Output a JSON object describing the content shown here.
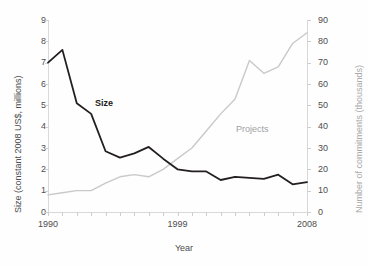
{
  "chart_data": {
    "type": "line",
    "title": "",
    "xlabel": "Year",
    "ylabel": "Size (constant 2008 US$, millions)",
    "y2label": "Number of commitments (thousands)",
    "x": [
      1990,
      1991,
      1992,
      1993,
      1994,
      1995,
      1996,
      1997,
      1998,
      1999,
      2000,
      2001,
      2002,
      2003,
      2004,
      2005,
      2006,
      2007,
      2008
    ],
    "xlim": [
      1990,
      2008
    ],
    "ylim": [
      0,
      9
    ],
    "y2lim": [
      0,
      90
    ],
    "xticks_labeled": [
      "1990",
      "1999",
      "2008"
    ],
    "yticks": [
      "0",
      "1",
      "2",
      "3",
      "4",
      "5",
      "6",
      "7",
      "8",
      "9"
    ],
    "y2ticks": [
      "0",
      "10",
      "20",
      "30",
      "40",
      "50",
      "60",
      "70",
      "80",
      "90"
    ],
    "grid": false,
    "legend_position": "inline-annotations",
    "series": [
      {
        "name": "Size",
        "axis": "left",
        "color": "#231f20",
        "label_text": "Size",
        "values": [
          7.0,
          7.6,
          5.1,
          4.6,
          2.85,
          2.55,
          2.75,
          3.05,
          2.5,
          2.0,
          1.9,
          1.9,
          1.5,
          1.65,
          1.6,
          1.55,
          1.75,
          1.3,
          1.4
        ]
      },
      {
        "name": "Projects",
        "axis": "right",
        "color": "#c9c9c9",
        "label_text": "Projects",
        "values": [
          8,
          9,
          10,
          10,
          13.5,
          16.5,
          17.5,
          16.5,
          20,
          25,
          30,
          38,
          46,
          53,
          71,
          65,
          68,
          79,
          84
        ]
      }
    ]
  },
  "axes": {
    "left": {
      "title": "Size (constant 2008 US$, millions)",
      "ticks": [
        {
          "label": "9",
          "value": 9
        },
        {
          "label": "8",
          "value": 8
        },
        {
          "label": "7",
          "value": 7
        },
        {
          "label": "6",
          "value": 6
        },
        {
          "label": "5",
          "value": 5
        },
        {
          "label": "4",
          "value": 4
        },
        {
          "label": "3",
          "value": 3
        },
        {
          "label": "2",
          "value": 2
        },
        {
          "label": "1",
          "value": 1
        },
        {
          "label": "0",
          "value": 0
        }
      ]
    },
    "right": {
      "title": "Number of commitments (thousands)",
      "ticks": [
        {
          "label": "90",
          "value": 90
        },
        {
          "label": "80",
          "value": 80
        },
        {
          "label": "70",
          "value": 70
        },
        {
          "label": "60",
          "value": 60
        },
        {
          "label": "50",
          "value": 50
        },
        {
          "label": "40",
          "value": 40
        },
        {
          "label": "30",
          "value": 30
        },
        {
          "label": "20",
          "value": 20
        },
        {
          "label": "10",
          "value": 10
        },
        {
          "label": "0",
          "value": 0
        }
      ]
    },
    "bottom": {
      "title": "Year",
      "ticks": [
        {
          "label": "1990",
          "value": 1990
        },
        {
          "label": "1999",
          "value": 1999
        },
        {
          "label": "2008",
          "value": 2008
        }
      ]
    }
  },
  "annotations": {
    "size_label": "Size",
    "projects_label": "Projects"
  },
  "colors": {
    "size_line": "#231f20",
    "projects_line": "#c9c9c9",
    "axis": "#d9d9d9",
    "text": "#4d4d4f",
    "right_title_text": "#a9a9ab"
  }
}
